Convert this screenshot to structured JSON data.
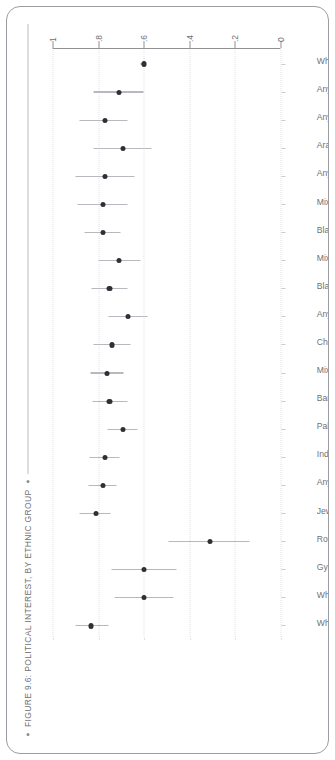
{
  "figure": {
    "caption": "FIGURE 9.6: POLITICAL INTEREST, BY ETHNIC GROUP",
    "bullet_left": "•",
    "bullet_right": "•"
  },
  "chart_data": {
    "type": "scatter",
    "orientation": "vertical-labels",
    "title": "FIGURE 9.6: POLITICAL INTEREST, BY ETHNIC GROUP",
    "xlabel": "",
    "ylabel": "",
    "ylim": [
      0,
      1
    ],
    "yticks": [
      0,
      0.2,
      0.4,
      0.6,
      0.8,
      1
    ],
    "ytick_labels": [
      "0",
      ".2",
      ".4",
      ".6",
      ".8",
      "1"
    ],
    "grid": true,
    "legend": null,
    "categories": [
      "White Irish",
      "White Eastern European",
      "Gypsy/Traveller",
      "Roma",
      "Jewish",
      "Any other White background",
      "Indian",
      "Pakistani",
      "Bangladeshi",
      "Mixed White and Asian",
      "Chinese",
      "Any other Asian background",
      "Black Caribbean",
      "Mixed White and Black Caribbean",
      "Black African",
      "Mixed White and Black African",
      "Any other Black background",
      "Arab",
      "Any other mixed/multiple background",
      "Any other ethnic group",
      "White British"
    ],
    "value_labels": [
      ".83",
      ".60",
      ".60",
      ".31",
      ".81",
      ".78",
      ".77",
      ".69",
      ".75",
      ".76",
      ".74",
      ".67",
      ".75",
      ".71",
      ".78",
      ".78",
      ".77",
      ".69",
      ".77",
      ".71",
      ".60"
    ],
    "values": [
      0.83,
      0.6,
      0.6,
      0.31,
      0.81,
      0.78,
      0.77,
      0.69,
      0.75,
      0.76,
      0.74,
      0.67,
      0.75,
      0.71,
      0.78,
      0.78,
      0.77,
      0.69,
      0.77,
      0.71,
      0.6
    ],
    "ci_low": [
      0.755,
      0.468,
      0.455,
      0.135,
      0.745,
      0.718,
      0.705,
      0.625,
      0.672,
      0.69,
      0.66,
      0.585,
      0.672,
      0.615,
      0.7,
      0.672,
      0.64,
      0.565,
      0.67,
      0.6,
      0.59
    ],
    "ci_high": [
      0.9,
      0.73,
      0.742,
      0.49,
      0.88,
      0.842,
      0.838,
      0.76,
      0.825,
      0.832,
      0.818,
      0.755,
      0.828,
      0.8,
      0.86,
      0.89,
      0.898,
      0.82,
      0.88,
      0.818,
      0.615
    ],
    "marker_color": "#2f3033",
    "whisker_color": "#b6b9bd",
    "grid_color": "#dfe1e3",
    "axis_color": "#8f9295"
  }
}
